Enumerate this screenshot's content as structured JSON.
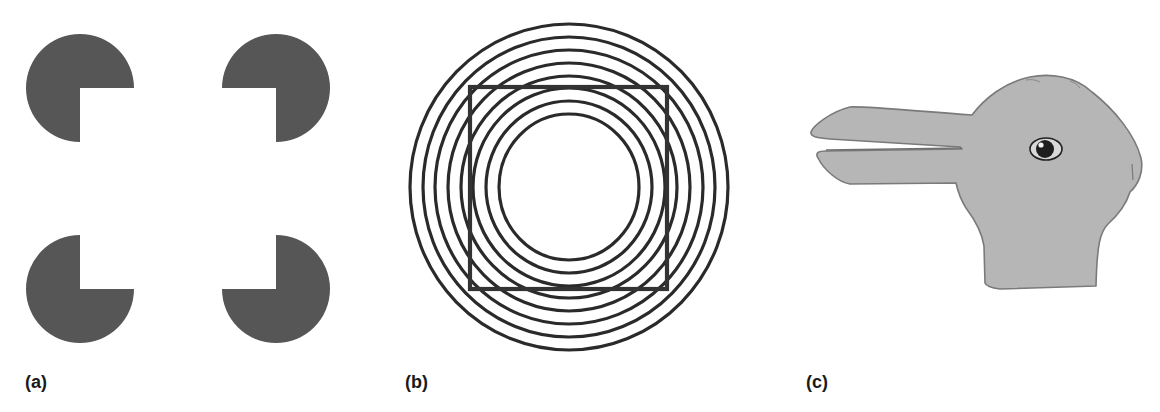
{
  "figure": {
    "panels": [
      {
        "id": "a",
        "label": "(a)",
        "illusion": "Kanizsa illusory square",
        "element": "four pac-man shapes (circles with a quarter cut out), cut-outs facing inward forming an implied square"
      },
      {
        "id": "b",
        "label": "(b)",
        "illusion": "Orbison / concentric-circles square distortion",
        "element": "eight concentric circles with a superimposed square outline"
      },
      {
        "id": "c",
        "label": "(c)",
        "illusion": "Duck-rabbit ambiguous figure",
        "element": "gray head facing left with two long protrusions (duck bill / rabbit ears) and one eye"
      }
    ]
  },
  "colors": {
    "background": "#ffffff",
    "pacman_fill": "#565656",
    "circle_stroke": "#2a2a2a",
    "square_stroke": "#333333",
    "duck_rabbit_fill": "#b6b6b6",
    "duck_rabbit_outline": "#7a7a7a",
    "eye_dark": "#1e1e1e",
    "label_text": "#1a1a1a"
  },
  "icons": {
    "pacman": "pacman-shape-icon",
    "concentric": "concentric-circles-icon",
    "duck_rabbit": "duck-rabbit-icon"
  }
}
